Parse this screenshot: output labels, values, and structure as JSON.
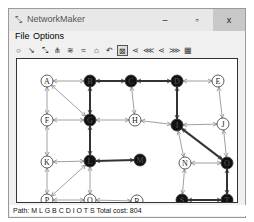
{
  "window": {
    "title": "NetworkMaker",
    "controls": {
      "minimize": "–",
      "maximize": "▫",
      "close": "x"
    }
  },
  "menu": {
    "items": [
      {
        "label": "File",
        "underline": "F"
      },
      {
        "label": "Options",
        "underline": "O"
      }
    ]
  },
  "toolbar": {
    "tools": [
      {
        "icon": "new-node-icon",
        "glyph": "○",
        "active": false
      },
      {
        "icon": "one-way-link-icon",
        "glyph": "↘",
        "active": false
      },
      {
        "icon": "two-way-link-icon",
        "glyph": "⤡",
        "active": false
      },
      {
        "icon": "tree-icon",
        "glyph": "⋔",
        "active": false
      },
      {
        "icon": "spanning-tree-icon",
        "glyph": "≋",
        "active": false
      },
      {
        "icon": "minimal-tree-icon",
        "glyph": "≈",
        "active": false
      },
      {
        "icon": "network-icon",
        "glyph": "⌂",
        "active": false
      },
      {
        "icon": "path-icon",
        "glyph": "↶",
        "active": false
      },
      {
        "icon": "shortest-path-icon",
        "glyph": "⊠",
        "active": true
      },
      {
        "icon": "flow-icon",
        "glyph": "⋖",
        "active": false
      },
      {
        "icon": "max-flow-icon",
        "glyph": "⋘",
        "active": false
      },
      {
        "icon": "min-flow-icon",
        "glyph": "⋖",
        "active": false
      },
      {
        "icon": "cut-icon",
        "glyph": "⋙",
        "active": false
      },
      {
        "icon": "grid-icon",
        "glyph": "▦",
        "active": false
      }
    ]
  },
  "graph": {
    "nodes": [
      {
        "id": "A",
        "x": 30,
        "y": 22,
        "highlight": false
      },
      {
        "id": "B",
        "x": 73,
        "y": 22,
        "highlight": true
      },
      {
        "id": "C",
        "x": 114,
        "y": 22,
        "highlight": true
      },
      {
        "id": "D",
        "x": 160,
        "y": 22,
        "highlight": true
      },
      {
        "id": "E",
        "x": 201,
        "y": 22,
        "highlight": false
      },
      {
        "id": "F",
        "x": 30,
        "y": 61,
        "highlight": false
      },
      {
        "id": "G",
        "x": 73,
        "y": 61,
        "highlight": true
      },
      {
        "id": "H",
        "x": 118,
        "y": 61,
        "highlight": false
      },
      {
        "id": "I",
        "x": 160,
        "y": 66,
        "highlight": true
      },
      {
        "id": "J",
        "x": 206,
        "y": 65,
        "highlight": false
      },
      {
        "id": "K",
        "x": 30,
        "y": 103,
        "highlight": false
      },
      {
        "id": "L",
        "x": 73,
        "y": 102,
        "highlight": true
      },
      {
        "id": "M",
        "x": 123,
        "y": 101,
        "highlight": true
      },
      {
        "id": "N",
        "x": 168,
        "y": 104,
        "highlight": false
      },
      {
        "id": "O",
        "x": 210,
        "y": 104,
        "highlight": true
      },
      {
        "id": "P",
        "x": 30,
        "y": 141,
        "highlight": false
      },
      {
        "id": "Q",
        "x": 73,
        "y": 141,
        "highlight": false
      },
      {
        "id": "R",
        "x": 120,
        "y": 142,
        "highlight": false
      },
      {
        "id": "S",
        "x": 165,
        "y": 141,
        "highlight": true
      },
      {
        "id": "T",
        "x": 210,
        "y": 141,
        "highlight": true
      }
    ],
    "edges": [
      {
        "from": "A",
        "to": "B",
        "path": false
      },
      {
        "from": "B",
        "to": "C",
        "path": true
      },
      {
        "from": "C",
        "to": "D",
        "path": true
      },
      {
        "from": "D",
        "to": "E",
        "path": false
      },
      {
        "from": "A",
        "to": "F",
        "path": false
      },
      {
        "from": "A",
        "to": "G",
        "path": false
      },
      {
        "from": "B",
        "to": "G",
        "path": true
      },
      {
        "from": "C",
        "to": "H",
        "path": false
      },
      {
        "from": "D",
        "to": "I",
        "path": true
      },
      {
        "from": "E",
        "to": "J",
        "path": false
      },
      {
        "from": "F",
        "to": "G",
        "path": false
      },
      {
        "from": "G",
        "to": "H",
        "path": false
      },
      {
        "from": "H",
        "to": "I",
        "path": false
      },
      {
        "from": "I",
        "to": "J",
        "path": false
      },
      {
        "from": "F",
        "to": "K",
        "path": false
      },
      {
        "from": "G",
        "to": "L",
        "path": true
      },
      {
        "from": "I",
        "to": "N",
        "path": false
      },
      {
        "from": "I",
        "to": "O",
        "path": true
      },
      {
        "from": "J",
        "to": "O",
        "path": false
      },
      {
        "from": "K",
        "to": "L",
        "path": false
      },
      {
        "from": "L",
        "to": "M",
        "path": true
      },
      {
        "from": "N",
        "to": "O",
        "path": false
      },
      {
        "from": "K",
        "to": "P",
        "path": false
      },
      {
        "from": "L",
        "to": "P",
        "path": false
      },
      {
        "from": "L",
        "to": "Q",
        "path": false
      },
      {
        "from": "N",
        "to": "S",
        "path": false
      },
      {
        "from": "O",
        "to": "T",
        "path": true
      },
      {
        "from": "P",
        "to": "Q",
        "path": false
      },
      {
        "from": "Q",
        "to": "R",
        "path": false
      },
      {
        "from": "S",
        "to": "T",
        "path": true
      }
    ],
    "colors": {
      "path_edge": "#333333",
      "edge": "#888888",
      "node_fill": "#ffffff",
      "node_highlight": "#111111"
    }
  },
  "status": {
    "text": "Path: M L G B C D I O T S Total cost: 804"
  }
}
